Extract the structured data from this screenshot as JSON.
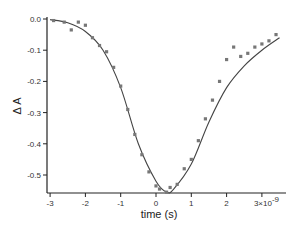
{
  "chart_data": {
    "type": "scatter",
    "title": "",
    "xlabel": "time (s)",
    "ylabel": "Δ A",
    "x_exponent_label": "3×10",
    "x_exponent_power": "-9",
    "xlim": [
      -3.0,
      3.7
    ],
    "ylim": [
      -0.56,
      0.0
    ],
    "xticks": [
      -3,
      -2,
      -1,
      0,
      1,
      2,
      3
    ],
    "xtick_labels": [
      "-3",
      "-2",
      "-1",
      "0",
      "1",
      "2",
      "3×10⁻⁹"
    ],
    "yticks": [
      0.0,
      -0.1,
      -0.2,
      -0.3,
      -0.4,
      -0.5
    ],
    "ytick_labels": [
      "0.0",
      "-0.1",
      "-0.2",
      "-0.3",
      "-0.4",
      "-0.5"
    ],
    "grid": false,
    "legend": null,
    "series": [
      {
        "name": "data",
        "style": "markers",
        "x": [
          -2.9,
          -2.6,
          -2.4,
          -2.2,
          -2.0,
          -1.8,
          -1.6,
          -1.4,
          -1.2,
          -1.0,
          -0.8,
          -0.6,
          -0.4,
          -0.2,
          0.0,
          0.1,
          0.3,
          0.4,
          0.6,
          0.8,
          1.0,
          1.2,
          1.4,
          1.6,
          1.8,
          2.0,
          2.2,
          2.4,
          2.6,
          2.8,
          3.0,
          3.2,
          3.4
        ],
        "y": [
          -0.005,
          -0.01,
          -0.035,
          -0.01,
          -0.02,
          -0.06,
          -0.085,
          -0.105,
          -0.155,
          -0.215,
          -0.29,
          -0.37,
          -0.435,
          -0.49,
          -0.535,
          -0.545,
          -0.555,
          -0.54,
          -0.53,
          -0.48,
          -0.45,
          -0.39,
          -0.32,
          -0.26,
          -0.2,
          -0.13,
          -0.09,
          -0.12,
          -0.11,
          -0.09,
          -0.08,
          -0.07,
          -0.05
        ]
      },
      {
        "name": "fit",
        "style": "line",
        "x": [
          -3.0,
          -2.5,
          -2.0,
          -1.5,
          -1.0,
          -0.5,
          0.0,
          0.3,
          0.5,
          1.0,
          1.5,
          2.0,
          2.5,
          3.0,
          3.5
        ],
        "y": [
          -0.002,
          -0.012,
          -0.04,
          -0.1,
          -0.22,
          -0.4,
          -0.52,
          -0.555,
          -0.545,
          -0.465,
          -0.33,
          -0.22,
          -0.15,
          -0.1,
          -0.06
        ]
      }
    ]
  },
  "colors": {
    "axis": "#222222",
    "marker": "#777777",
    "line": "#444444"
  }
}
